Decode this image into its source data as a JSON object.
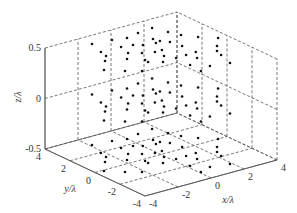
{
  "chart_data": {
    "type": "scatter",
    "subtype": "scatter3d",
    "title": "",
    "xlabel": "x/λ",
    "ylabel": "y/λ",
    "zlabel": "z/λ",
    "xlim": [
      -4,
      4
    ],
    "ylim": [
      -4,
      4
    ],
    "zlim": [
      -0.5,
      0.5
    ],
    "xticks": [
      "-4",
      "-2",
      "0",
      "2",
      "4"
    ],
    "yticks": [
      "4",
      "2",
      "0",
      "-2",
      "-4"
    ],
    "zticks": [
      "0.5",
      "0",
      "-0.5"
    ],
    "grid": true,
    "legend": null,
    "z_layers": [
      0.5,
      0,
      -0.5
    ],
    "series": [
      {
        "name": "array elements",
        "marker": "dot",
        "color": "#111111",
        "xy_per_layer": [
          [
            -1.87,
            3.05
          ],
          [
            -2.18,
            1.93
          ],
          [
            -2.31,
            1.35
          ],
          [
            -2.76,
            0.84
          ],
          [
            -3.53,
            -0.1
          ],
          [
            -0.78,
            2.89
          ],
          [
            -0.04,
            2.67
          ],
          [
            -1.0,
            1.87
          ],
          [
            0.79,
            2.88
          ],
          [
            -0.38,
            1.74
          ],
          [
            -1.22,
            1.02
          ],
          [
            -1.75,
            0.41
          ],
          [
            -2.81,
            -0.83
          ],
          [
            0.0,
            1.45
          ],
          [
            -0.69,
            0.61
          ],
          [
            -1.14,
            -0.23
          ],
          [
            -2.16,
            -1.33
          ],
          [
            0.66,
            1.28
          ],
          [
            1.74,
            3.01
          ],
          [
            2.02,
            2.11
          ],
          [
            0.88,
            1.8
          ],
          [
            0.98,
            1.38
          ],
          [
            1.28,
            0.98
          ],
          [
            2.28,
            1.41
          ],
          [
            1.42,
            0.19
          ],
          [
            2.77,
            0.69
          ],
          [
            1.46,
            -0.86
          ],
          [
            1.02,
            -1.54
          ],
          [
            -0.11,
            0.34
          ],
          [
            0.32,
            0.35
          ],
          [
            -0.09,
            -0.36
          ],
          [
            -1.19,
            -0.54
          ],
          [
            -0.62,
            -0.98
          ],
          [
            0.21,
            -0.93
          ],
          [
            0.84,
            -0.9
          ],
          [
            0.18,
            -2.09
          ],
          [
            0.86,
            -2.78
          ],
          [
            3.45,
            -0.01
          ],
          [
            2.76,
            -0.84
          ],
          [
            2.35,
            -1.38
          ],
          [
            2.18,
            -1.93
          ],
          [
            1.87,
            -3.05
          ],
          [
            0.1,
            -3.06
          ]
        ]
      }
    ]
  },
  "labels": {
    "zlabel": "z/λ",
    "ylabel": "y/λ",
    "xlabel": "x/λ"
  }
}
